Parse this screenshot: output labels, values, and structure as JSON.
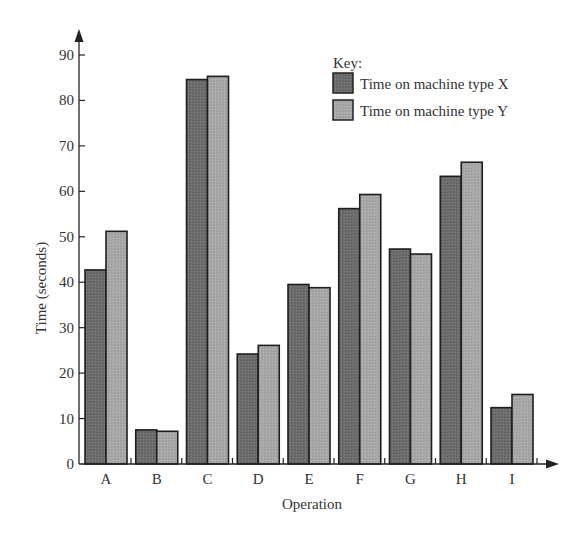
{
  "chart_data": {
    "type": "bar",
    "title": "",
    "xlabel": "Operation",
    "ylabel": "Time (seconds)",
    "ylim": [
      0,
      90
    ],
    "yticks": [
      0,
      10,
      20,
      30,
      40,
      50,
      60,
      70,
      80,
      90
    ],
    "grid": false,
    "legend_position": "top-right",
    "legend_title": "Key:",
    "categories": [
      "A",
      "B",
      "C",
      "D",
      "E",
      "F",
      "G",
      "H",
      "I"
    ],
    "series": [
      {
        "name": "Time on machine type X",
        "color": "#6e6e6e",
        "values": [
          42.7,
          7.5,
          84.6,
          24.2,
          39.5,
          56.2,
          47.3,
          63.3,
          12.4
        ]
      },
      {
        "name": "Time on machine type Y",
        "color": "#a8a8a8",
        "values": [
          51.2,
          7.2,
          85.3,
          26.1,
          38.8,
          59.3,
          46.2,
          66.4,
          15.3
        ]
      }
    ]
  }
}
